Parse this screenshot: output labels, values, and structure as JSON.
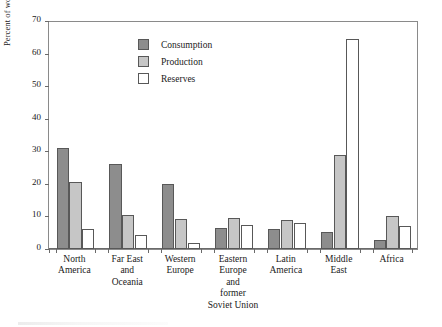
{
  "chart_data": {
    "type": "bar",
    "title": "",
    "xlabel": "",
    "ylabel": "Percent of world total",
    "ylim": [
      0,
      70
    ],
    "yticks": [
      0,
      10,
      20,
      30,
      40,
      50,
      60,
      70
    ],
    "grid": false,
    "legend_position": "upper-center-left",
    "categories": [
      "North\nAmerica",
      "Far East\nand\nOceania",
      "Western\nEurope",
      "Eastern\nEurope\nand\nformer\nSoviet Union",
      "Latin\nAmerica",
      "Middle\nEast",
      "Africa"
    ],
    "category_lines": [
      [
        "North",
        "America"
      ],
      [
        "Far East",
        "and",
        "Oceania"
      ],
      [
        "Western",
        "Europe"
      ],
      [
        "Eastern",
        "Europe",
        "and",
        "former",
        "Soviet Union"
      ],
      [
        "Latin",
        "America"
      ],
      [
        "Middle",
        "East"
      ],
      [
        "Africa"
      ]
    ],
    "series": [
      {
        "name": "Consumption",
        "color": "#8d8d8d",
        "values": [
          31.0,
          26.0,
          20.0,
          6.5,
          6.0,
          5.2,
          2.7
        ]
      },
      {
        "name": "Production",
        "color": "#c6c6c6",
        "values": [
          20.7,
          10.5,
          9.3,
          9.5,
          9.0,
          29.0,
          10.0
        ]
      },
      {
        "name": "Reserves",
        "color": "#ffffff",
        "values": [
          6.0,
          4.3,
          2.0,
          7.5,
          8.0,
          64.5,
          7.0
        ]
      }
    ]
  },
  "axis": {
    "y_title": "Percent of world total",
    "y_tick_labels": [
      "0",
      "10",
      "20",
      "30",
      "40",
      "50",
      "60",
      "70"
    ]
  },
  "legend": {
    "items": [
      {
        "label": "Consumption",
        "swatch": "consumption"
      },
      {
        "label": "Production",
        "swatch": "production"
      },
      {
        "label": "Reserves",
        "swatch": "reserves"
      }
    ]
  },
  "colors": {
    "consumption": "#8d8d8d",
    "production": "#c6c6c6",
    "reserves": "#ffffff",
    "bar_outline": "#585858",
    "frame": "#8a8a8a",
    "background": "#ffffff"
  }
}
